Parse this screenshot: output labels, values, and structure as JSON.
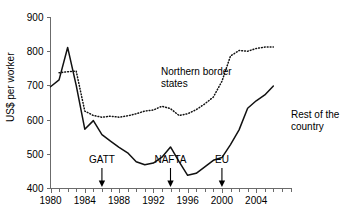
{
  "chart_data": {
    "type": "line",
    "title": "",
    "subtitle": "",
    "xlabel": "",
    "ylabel": "US$ per worker",
    "xlim": [
      1980,
      2008
    ],
    "ylim": [
      400,
      900
    ],
    "x_ticks_major": [
      1980,
      1984,
      1988,
      1992,
      1996,
      2000,
      2004
    ],
    "x_tick_labels": [
      "1980",
      "1984",
      "1988",
      "1992",
      "1996",
      "2000",
      "2004"
    ],
    "x_ticks_minor_step": 1,
    "y_ticks": [
      400,
      500,
      600,
      700,
      800,
      900
    ],
    "y_tick_labels": [
      "400",
      "500",
      "600",
      "700",
      "800",
      "900"
    ],
    "grid": false,
    "legend": "inline-labels",
    "x": [
      1980,
      1981,
      1982,
      1983,
      1984,
      1985,
      1986,
      1987,
      1988,
      1989,
      1990,
      1991,
      1992,
      1993,
      1994,
      1995,
      1996,
      1997,
      1998,
      1999,
      2000,
      2001,
      2002,
      2003,
      2004,
      2005,
      2006
    ],
    "series": [
      {
        "name": "Northern border states",
        "style": "dotted",
        "x": [
          1981,
          1982,
          1983,
          1984,
          1985,
          1986,
          1987,
          1988,
          1989,
          1990,
          1991,
          1992,
          1993,
          1994,
          1995,
          1996,
          1997,
          1998,
          1999,
          2000,
          2001,
          2002,
          2003,
          2004,
          2005,
          2006
        ],
        "values": [
          737,
          740,
          742,
          625,
          612,
          607,
          610,
          607,
          611,
          617,
          625,
          628,
          639,
          632,
          612,
          617,
          629,
          646,
          666,
          712,
          786,
          802,
          800,
          808,
          812,
          812
        ]
      },
      {
        "name": "Rest of the country",
        "style": "solid",
        "x": [
          1980,
          1981,
          1982,
          1983,
          1984,
          1985,
          1986,
          1987,
          1988,
          1989,
          1990,
          1991,
          1992,
          1993,
          1994,
          1995,
          1996,
          1997,
          1998,
          1999,
          2000,
          2001,
          2002,
          2003,
          2004,
          2005,
          2006
        ],
        "values": [
          696,
          716,
          811,
          700,
          572,
          597,
          556,
          537,
          519,
          503,
          477,
          468,
          473,
          490,
          520,
          477,
          437,
          443,
          462,
          481,
          489,
          527,
          570,
          633,
          655,
          672,
          698
        ]
      }
    ],
    "series_labels": [
      {
        "name": "Northern border states",
        "line1": "Northern border",
        "line2": "states"
      },
      {
        "name": "Rest of the country",
        "line1": "Rest of the",
        "line2": "country"
      }
    ],
    "annotations": [
      {
        "label": "GATT",
        "x": 1986
      },
      {
        "label": "NAFTA",
        "x": 1994
      },
      {
        "label": "EU",
        "x": 2000
      }
    ]
  },
  "axis": {
    "ylabel": "US$ per worker"
  }
}
